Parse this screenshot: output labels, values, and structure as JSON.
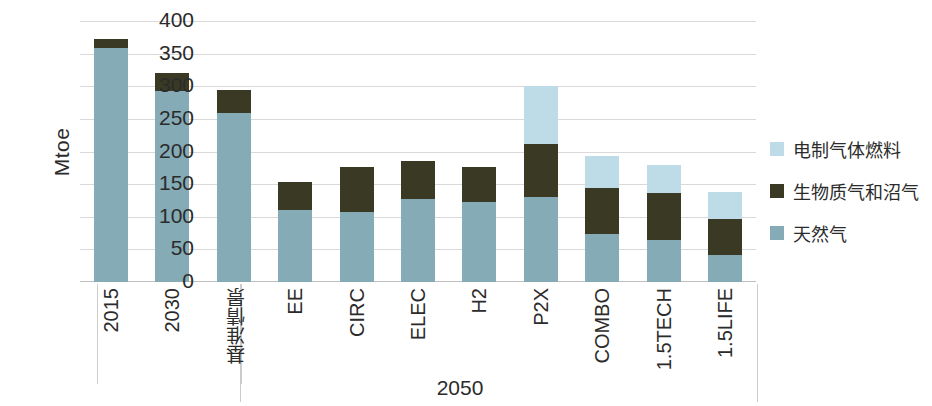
{
  "chart_data": {
    "type": "bar",
    "stacked": true,
    "title": "",
    "xlabel": "2050",
    "ylabel": "Mtoe",
    "ylim": [
      0,
      400
    ],
    "ytick_step": 50,
    "yticks": [
      400,
      350,
      300,
      250,
      200,
      150,
      100,
      50,
      0
    ],
    "grid": true,
    "legend_position": "right",
    "categories": [
      "2015",
      "2030",
      "基准情景",
      "EE",
      "CIRC",
      "ELEC",
      "H2",
      "P2X",
      "COMBO",
      "1.5TECH",
      "1.5LIFE"
    ],
    "groups": [
      {
        "label": "",
        "categories": [
          "2015",
          "2030"
        ]
      },
      {
        "label": "2050",
        "categories": [
          "基准情景",
          "EE",
          "CIRC",
          "ELEC",
          "H2",
          "P2X",
          "COMBO",
          "1.5TECH",
          "1.5LIFE"
        ]
      }
    ],
    "series": [
      {
        "name": "天然气",
        "color": "#84abb6",
        "values": [
          358,
          292,
          259,
          110,
          107,
          127,
          122,
          131,
          73,
          64,
          42
        ]
      },
      {
        "name": "生物质气和沼气",
        "color": "#3a3a24",
        "values": [
          14,
          28,
          36,
          44,
          69,
          58,
          54,
          80,
          71,
          72,
          55
        ]
      },
      {
        "name": "电制气体燃料",
        "color": "#bedce7",
        "values": [
          0,
          0,
          0,
          0,
          0,
          0,
          0,
          89,
          49,
          43,
          41
        ]
      }
    ],
    "totals": [
      372,
      320,
      295,
      154,
      176,
      185,
      176,
      300,
      193,
      179,
      138
    ]
  },
  "axis": {
    "y_title": "Mtoe",
    "x_group_label": "2050"
  },
  "legend": {
    "items": [
      {
        "label": "电制气体燃料",
        "color": "#bedce7"
      },
      {
        "label": "生物质气和沼气",
        "color": "#3a3a24"
      },
      {
        "label": "天然气",
        "color": "#84abb6"
      }
    ]
  }
}
